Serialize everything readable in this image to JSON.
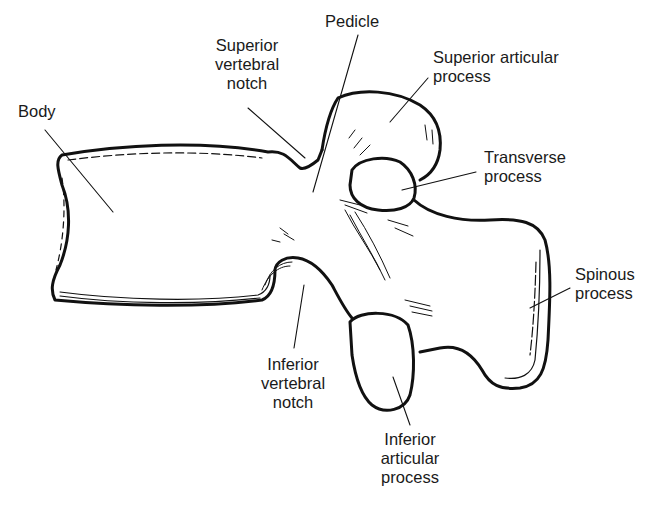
{
  "colors": {
    "line": "#111111",
    "text": "#1a1a1a",
    "background": "#ffffff"
  },
  "labels": {
    "body": "Body",
    "superior_vertebral_notch": "Superior\nvertebral\nnotch",
    "pedicle": "Pedicle",
    "superior_articular_process": "Superior articular\nprocess",
    "transverse_process": "Transverse\nprocess",
    "spinous_process": "Spinous\nprocess",
    "inferior_vertebral_notch": "Inferior\nvertebral\nnotch",
    "inferior_articular_process": "Inferior\narticular\nprocess"
  }
}
